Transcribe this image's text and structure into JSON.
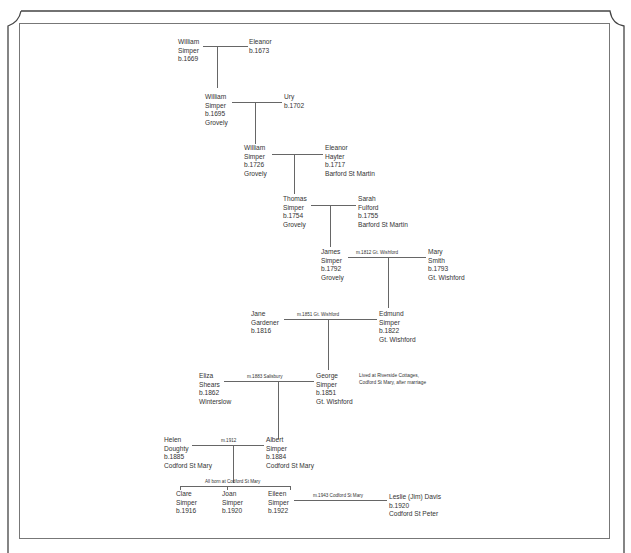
{
  "people": [
    {
      "id": "william_1669",
      "lines": [
        "William",
        "Simper",
        "b.1669"
      ]
    },
    {
      "id": "eleanor_1673",
      "lines": [
        "Eleanor",
        "b.1673"
      ]
    },
    {
      "id": "william_1695",
      "lines": [
        "William",
        "Simper",
        "b.1695",
        "Grovely"
      ]
    },
    {
      "id": "ury_1702",
      "lines": [
        "Ury",
        "b.1702"
      ]
    },
    {
      "id": "william_1726",
      "lines": [
        "William",
        "Simper",
        "b.1726",
        "Grovely"
      ]
    },
    {
      "id": "eleanor_hayter",
      "lines": [
        "Eleanor",
        "Hayter",
        "b.1717",
        "Barford St Martin"
      ]
    },
    {
      "id": "thomas_1754",
      "lines": [
        "Thomas",
        "Simper",
        "b.1754",
        "Grovely"
      ]
    },
    {
      "id": "sarah_fulford",
      "lines": [
        "Sarah",
        "Fulford",
        "b.1755",
        "Barford St Martin"
      ]
    },
    {
      "id": "james_1792",
      "lines": [
        "James",
        "Simper",
        "b.1792",
        "Grovely"
      ]
    },
    {
      "id": "mary_smith",
      "lines": [
        "Mary",
        "Smith",
        "b.1793",
        "Gt. Wishford"
      ]
    },
    {
      "id": "jane_gardener",
      "lines": [
        "Jane",
        "Gardener",
        "b.1816"
      ]
    },
    {
      "id": "edmund_1822",
      "lines": [
        "Edmund",
        "Simper",
        "b.1822",
        "Gt. Wishford"
      ]
    },
    {
      "id": "eliza_shears",
      "lines": [
        "Eliza",
        "Shears",
        "b.1862",
        "Winterslow"
      ]
    },
    {
      "id": "george_1851",
      "lines": [
        "George",
        "Simper",
        "b.1851",
        "Gt. Wishford"
      ]
    },
    {
      "id": "helen_doughty",
      "lines": [
        "Helen",
        "Doughty",
        "b.1885",
        "Codford St Mary"
      ]
    },
    {
      "id": "albert_1884",
      "lines": [
        "Albert",
        "Simper",
        "b.1884",
        "Codford St Mary"
      ]
    },
    {
      "id": "clare_1916",
      "lines": [
        "Clare",
        "Simper",
        "b.1916"
      ]
    },
    {
      "id": "joan_1920",
      "lines": [
        "Joan",
        "Simper",
        "b.1920"
      ]
    },
    {
      "id": "eileen_1922",
      "lines": [
        "Eileen",
        "Simper",
        "b.1922"
      ]
    },
    {
      "id": "leslie_davis",
      "lines": [
        "Leslie (Jim) Davis",
        "b.1920",
        "Codford St Peter"
      ]
    }
  ],
  "marriages": {
    "james_mary": "m.1812 Gt. Wishford",
    "jane_edmund": "m.1851 Gt. Wishford",
    "eliza_george": "m.1883 Salisbury",
    "helen_albert": "m.1912",
    "eileen_leslie": "m.1943 Codford St Mary"
  },
  "notes": {
    "george_residence": [
      "Lived at Riverside Cottages,",
      "Codford St Mary, after marriage"
    ],
    "children_birthplace": "All born at Codford St Mary"
  },
  "colors": {
    "background": "#ffffff",
    "line": "#666666",
    "text": "#333333",
    "frame": "#444444"
  }
}
